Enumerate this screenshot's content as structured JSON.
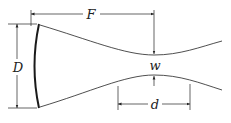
{
  "diagram": {
    "labels": {
      "focal_distance": "F",
      "aperture_diameter": "D",
      "beam_waist": "w",
      "depth_of_focus": "d"
    },
    "colors": {
      "stroke": "#222222",
      "mirror": "#1a1a1a",
      "background": "#ffffff"
    }
  }
}
